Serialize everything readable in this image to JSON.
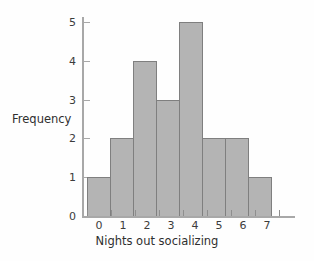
{
  "chart_data": {
    "type": "bar",
    "title": "",
    "subtitle": "",
    "categories": [
      "0",
      "1",
      "2",
      "3",
      "4",
      "5",
      "6",
      "7"
    ],
    "values": [
      1,
      2,
      4,
      3,
      5,
      2,
      2,
      1
    ],
    "xlabel": "Nights out socializing",
    "ylabel": "Frequency",
    "ylim": [
      0,
      5
    ],
    "yticks": [
      "5",
      "4",
      "3",
      "2",
      "1",
      "0"
    ],
    "ytick_values": [
      5,
      4,
      3,
      2,
      1,
      0
    ],
    "xticks": [
      "0",
      "1",
      "2",
      "3",
      "4",
      "5",
      "6",
      "7"
    ],
    "grid": false,
    "legend": false,
    "legend_position": "none",
    "bar_fill_color": "#b4b4b4",
    "bar_border_color": "#7f7f7f",
    "axis_color": "#a8a8a8",
    "text_color": "#3c3c3c",
    "background_color": "#fefefe"
  }
}
